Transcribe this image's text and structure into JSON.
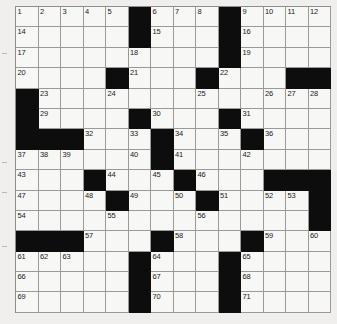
{
  "puzzle": {
    "title": "Crossword Grid",
    "columns": 14,
    "rows": 15,
    "colors": {
      "block": "#0d0d0d",
      "cell": "#f7f7f5",
      "gridline": "#9a9a9a",
      "page": "#f0efee",
      "number": "#1a1a1a"
    },
    "legend": {
      "black_label": "block",
      "white_label": "open cell"
    },
    "cells": [
      [
        {
          "n": "1"
        },
        {
          "n": "2"
        },
        {
          "n": "3"
        },
        {
          "n": "4"
        },
        {
          "n": "5"
        },
        {
          "b": true
        },
        {
          "n": "6"
        },
        {
          "n": "7"
        },
        {
          "n": "8"
        },
        {
          "b": true
        },
        {
          "n": "9"
        },
        {
          "n": "10"
        },
        {
          "n": "11"
        },
        {
          "n": "12"
        }
      ],
      [
        {
          "n": "14"
        },
        {},
        {},
        {},
        {},
        {
          "b": true
        },
        {
          "n": "15"
        },
        {},
        {},
        {
          "b": true
        },
        {
          "n": "16"
        },
        {},
        {},
        {}
      ],
      [
        {
          "n": "17"
        },
        {},
        {},
        {},
        {},
        {
          "n": "18"
        },
        {},
        {},
        {},
        {
          "b": true
        },
        {
          "n": "19"
        },
        {},
        {},
        {}
      ],
      [
        {
          "n": "20"
        },
        {},
        {},
        {},
        {
          "b": true
        },
        {
          "n": "21"
        },
        {},
        {},
        {
          "b": true
        },
        {
          "n": "22"
        },
        {},
        {},
        {
          "b": true
        },
        {
          "b": true
        }
      ],
      [
        {
          "b": true
        },
        {
          "n": "23"
        },
        {},
        {},
        {
          "n": "24"
        },
        {},
        {},
        {},
        {
          "n": "25"
        },
        {},
        {},
        {
          "n": "26"
        },
        {
          "n": "27"
        },
        {
          "n": "28"
        }
      ],
      [
        {
          "b": true
        },
        {
          "n": "29"
        },
        {},
        {},
        {},
        {
          "b": true
        },
        {
          "n": "30"
        },
        {},
        {},
        {
          "b": true
        },
        {
          "n": "31"
        },
        {},
        {},
        {}
      ],
      [
        {
          "b": true
        },
        {
          "b": true
        },
        {
          "b": true
        },
        {
          "n": "32"
        },
        {},
        {
          "n": "33"
        },
        {
          "b": true
        },
        {
          "n": "34"
        },
        {},
        {
          "n": "35"
        },
        {
          "b": true
        },
        {
          "n": "36"
        },
        {},
        {}
      ],
      [
        {
          "n": "37"
        },
        {
          "n": "38"
        },
        {
          "n": "39"
        },
        {},
        {},
        {
          "n": "40"
        },
        {
          "b": true
        },
        {
          "n": "41"
        },
        {},
        {},
        {
          "n": "42"
        },
        {},
        {},
        {}
      ],
      [
        {
          "n": "43"
        },
        {},
        {},
        {
          "b": true
        },
        {
          "n": "44"
        },
        {},
        {
          "n": "45"
        },
        {
          "b": true
        },
        {
          "n": "46"
        },
        {},
        {},
        {
          "b": true
        },
        {
          "b": true
        },
        {
          "b": true
        }
      ],
      [
        {
          "n": "47"
        },
        {},
        {},
        {
          "n": "48"
        },
        {
          "b": true
        },
        {
          "n": "49"
        },
        {},
        {
          "n": "50"
        },
        {
          "b": true
        },
        {
          "n": "51"
        },
        {},
        {
          "n": "52"
        },
        {
          "n": "53"
        },
        {
          "b": true
        }
      ],
      [
        {
          "n": "54"
        },
        {},
        {},
        {},
        {
          "n": "55"
        },
        {},
        {},
        {},
        {
          "n": "56"
        },
        {},
        {},
        {},
        {},
        {
          "b": true
        }
      ],
      [
        {
          "b": true
        },
        {
          "b": true
        },
        {
          "b": true
        },
        {
          "n": "57"
        },
        {},
        {},
        {
          "b": true
        },
        {
          "n": "58"
        },
        {},
        {},
        {
          "b": true
        },
        {
          "n": "59"
        },
        {},
        {
          "n": "60"
        }
      ],
      [
        {
          "n": "61"
        },
        {
          "n": "62"
        },
        {
          "n": "63"
        },
        {},
        {},
        {
          "b": true
        },
        {
          "n": "64"
        },
        {},
        {},
        {
          "b": true
        },
        {
          "n": "65"
        },
        {},
        {},
        {}
      ],
      [
        {
          "n": "66"
        },
        {},
        {},
        {},
        {},
        {
          "b": true
        },
        {
          "n": "67"
        },
        {},
        {},
        {
          "b": true
        },
        {
          "n": "68"
        },
        {},
        {},
        {}
      ],
      [
        {
          "n": "69"
        },
        {},
        {},
        {},
        {},
        {
          "b": true
        },
        {
          "n": "70"
        },
        {},
        {},
        {
          "b": true
        },
        {
          "n": "71"
        },
        {},
        {},
        {}
      ]
    ]
  }
}
